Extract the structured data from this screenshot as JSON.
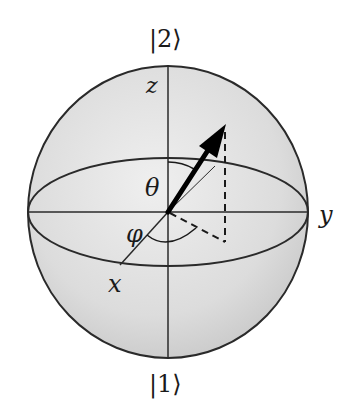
{
  "diagram": {
    "type": "bloch-sphere",
    "labels": {
      "top_state": "|2⟩",
      "bottom_state": "|1⟩",
      "z_axis": "z",
      "x_axis": "x",
      "y_axis": "y",
      "polar_angle": "θ",
      "azimuth_angle": "φ"
    },
    "colors": {
      "background": "#ffffff",
      "sphere_fill_light": "#ececec",
      "sphere_fill_dark": "#cfcfcf",
      "stroke": "#1a1a1a"
    }
  }
}
